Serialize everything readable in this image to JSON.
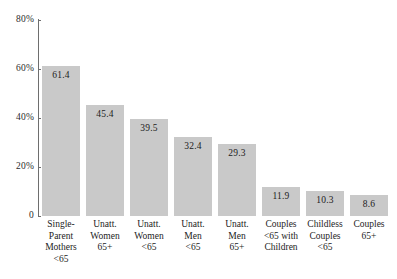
{
  "chart_data": {
    "type": "bar",
    "title": "",
    "subtitle": "",
    "xlabel": "",
    "ylabel": "",
    "ylim": [
      0,
      80
    ],
    "grid": false,
    "legend": false,
    "value_labels_inside_bars": true,
    "bar_color": "#c9c9c9",
    "axis_color": "#6e6e6e",
    "background_color": "#ffffff",
    "categories": [
      "Single-Parent Mothers <65",
      "Unatt. Women 65+",
      "Unatt. Women <65",
      "Unatt. Men <65",
      "Unatt. Men 65+",
      "Couples <65 with Children",
      "Childless Couples <65",
      "Couples 65+"
    ],
    "category_lines": [
      [
        "Single-",
        "Parent",
        "Mothers",
        "<65"
      ],
      [
        "Unatt.",
        "Women",
        "65+"
      ],
      [
        "Unatt.",
        "Women",
        "<65"
      ],
      [
        "Unatt.",
        "Men",
        "<65"
      ],
      [
        "Unatt.",
        "Men",
        "65+"
      ],
      [
        "Couples",
        "<65 with",
        "Children"
      ],
      [
        "Childless",
        "Couples",
        "<65"
      ],
      [
        "Couples",
        "65+"
      ]
    ],
    "values": [
      61.4,
      45.4,
      39.5,
      32.4,
      29.3,
      11.9,
      10.3,
      8.6
    ],
    "value_labels": [
      "61.4",
      "45.4",
      "39.5",
      "32.4",
      "29.3",
      "11.9",
      "10.3",
      "8.6"
    ],
    "yticks": [
      0,
      20,
      40,
      60,
      80
    ],
    "ytick_labels": [
      "0",
      "20%",
      "40%",
      "60%",
      "80%"
    ]
  }
}
